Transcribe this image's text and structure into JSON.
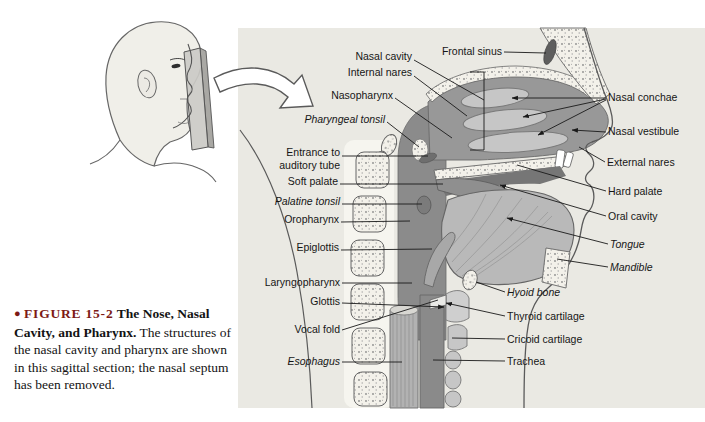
{
  "page": {
    "background": "#ffffff"
  },
  "colors": {
    "panel_background": "#eae9e3",
    "figure_label_red": "#7d1a15",
    "leader_line": "#1a1a1a",
    "anatomy_dark_gray": "#8b8b8b",
    "anatomy_light_gray": "#c6c6c6"
  },
  "inset": {
    "icon": "head-profile-with-sagittal-plane",
    "arrow_icon": "curved-pointer-arrow"
  },
  "figure": {
    "labels": [
      {
        "id": "nasal-cavity",
        "text": "Nasal cavity",
        "italic": false
      },
      {
        "id": "internal-nares",
        "text": "Internal nares",
        "italic": false
      },
      {
        "id": "nasopharynx",
        "text": "Nasopharynx",
        "italic": false
      },
      {
        "id": "pharyngeal-tonsil",
        "text": "Pharyngeal tonsil",
        "italic": true
      },
      {
        "id": "entrance-auditory-tube",
        "text": "Entrance to\nauditory tube",
        "italic": false
      },
      {
        "id": "soft-palate",
        "text": "Soft palate",
        "italic": false
      },
      {
        "id": "palatine-tonsil",
        "text": "Palatine tonsil",
        "italic": true
      },
      {
        "id": "oropharynx",
        "text": "Oropharynx",
        "italic": false
      },
      {
        "id": "epiglottis",
        "text": "Epiglottis",
        "italic": false
      },
      {
        "id": "laryngopharynx",
        "text": "Laryngopharynx",
        "italic": false
      },
      {
        "id": "glottis",
        "text": "Glottis",
        "italic": false
      },
      {
        "id": "vocal-fold",
        "text": "Vocal fold",
        "italic": false
      },
      {
        "id": "esophagus",
        "text": "Esophagus",
        "italic": true
      },
      {
        "id": "frontal-sinus",
        "text": "Frontal sinus",
        "italic": false
      },
      {
        "id": "nasal-conchae",
        "text": "Nasal conchae",
        "italic": false
      },
      {
        "id": "nasal-vestibule",
        "text": "Nasal vestibule",
        "italic": false
      },
      {
        "id": "external-nares",
        "text": "External nares",
        "italic": false
      },
      {
        "id": "hard-palate",
        "text": "Hard palate",
        "italic": false
      },
      {
        "id": "oral-cavity",
        "text": "Oral cavity",
        "italic": false
      },
      {
        "id": "tongue",
        "text": "Tongue",
        "italic": true
      },
      {
        "id": "mandible",
        "text": "Mandible",
        "italic": true
      },
      {
        "id": "hyoid-bone",
        "text": "Hyoid bone",
        "italic": true
      },
      {
        "id": "thyroid-cartilage",
        "text": "Thyroid cartilage",
        "italic": false
      },
      {
        "id": "cricoid-cartilage",
        "text": "Cricoid cartilage",
        "italic": false
      },
      {
        "id": "trachea",
        "text": "Trachea",
        "italic": false
      }
    ]
  },
  "caption": {
    "bullet": "●",
    "figure_label": "FIGURE 15-2",
    "title": "The Nose, Nasal Cavity, and Pharynx.",
    "body": "The structures of the nasal cavity and pharynx are shown in this sagittal section; the nasal septum has been removed."
  }
}
